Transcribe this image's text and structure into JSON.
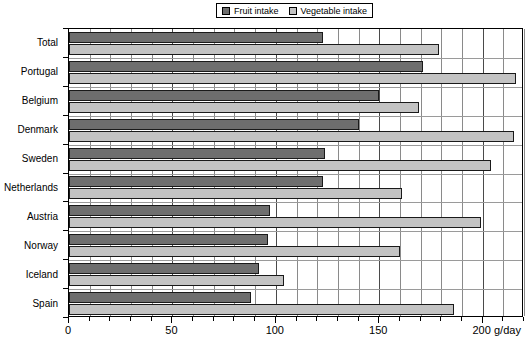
{
  "chart_data": {
    "type": "bar",
    "orientation": "horizontal",
    "title": "",
    "xlabel": "g/day",
    "ylabel": "",
    "xlim": [
      0,
      220
    ],
    "xticks": [
      0,
      50,
      100,
      150,
      200
    ],
    "xtick_labels": [
      "0",
      "50",
      "100",
      "150",
      "200"
    ],
    "grid": true,
    "grid_minor_step": 10,
    "legend_position": "top-center",
    "categories": [
      "Total",
      "Portugal",
      "Belgium",
      "Denmark",
      "Sweden",
      "Netherlands",
      "Austria",
      "Norway",
      "Iceland",
      "Spain"
    ],
    "series": [
      {
        "name": "Fruit intake",
        "color": "#6e6e6e",
        "values": [
          123,
          171,
          150,
          140,
          124,
          123,
          97,
          96,
          92,
          88
        ]
      },
      {
        "name": "Vegetable intake",
        "color": "#c3c3c3",
        "values": [
          179,
          216,
          169,
          215,
          204,
          161,
          199,
          160,
          104,
          186
        ]
      }
    ]
  },
  "legend": {
    "items": [
      {
        "label": "Fruit intake",
        "swatch": "fruit"
      },
      {
        "label": "Vegetable intake",
        "swatch": "veg"
      }
    ]
  },
  "axis": {
    "x_unit": "g/day"
  }
}
